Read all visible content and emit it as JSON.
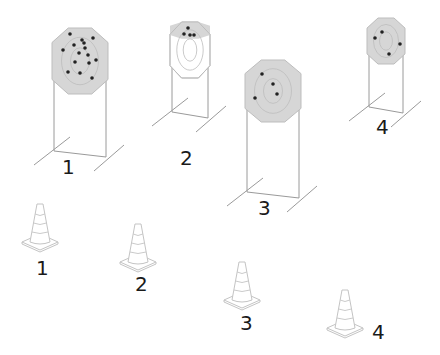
{
  "colors": {
    "target_fill": "#d6d6d6",
    "ring_stroke": "#bdbdbd",
    "line": "#9a9a9a",
    "hole": "#222222",
    "cone_stroke": "#c4c4c4",
    "label": "#1a1a1a"
  },
  "targets": [
    {
      "label": "1",
      "cx": 80,
      "top": 28,
      "w": 56,
      "h": 66,
      "base": 157,
      "label_x": 62,
      "label_y": 157,
      "holes": [
        [
          70,
          34
        ],
        [
          82,
          40
        ],
        [
          93,
          38
        ],
        [
          63,
          50
        ],
        [
          74,
          45
        ],
        [
          85,
          48
        ],
        [
          79,
          53
        ],
        [
          88,
          55
        ],
        [
          96,
          60
        ],
        [
          75,
          62
        ],
        [
          89,
          63
        ],
        [
          68,
          72
        ],
        [
          80,
          73
        ],
        [
          92,
          78
        ],
        [
          84,
          43
        ]
      ]
    },
    {
      "label": "2",
      "cx": 190,
      "top": 22,
      "w": 40,
      "h": 56,
      "base": 118,
      "label_x": 180,
      "label_y": 148,
      "faded": true,
      "holes": [
        [
          188,
          28
        ],
        [
          184,
          34
        ],
        [
          190,
          35
        ],
        [
          194,
          35
        ]
      ]
    },
    {
      "label": "3",
      "cx": 273,
      "top": 60,
      "w": 56,
      "h": 62,
      "base": 198,
      "label_x": 258,
      "label_y": 198,
      "holes": [
        [
          262,
          74
        ],
        [
          273,
          84
        ],
        [
          277,
          94
        ],
        [
          255,
          98
        ]
      ]
    },
    {
      "label": "4",
      "cx": 386,
      "top": 18,
      "w": 38,
      "h": 46,
      "base": 113,
      "label_x": 376,
      "label_y": 117,
      "holes": [
        [
          382,
          32
        ],
        [
          375,
          38
        ],
        [
          400,
          44
        ],
        [
          389,
          54
        ]
      ]
    }
  ],
  "cones": [
    {
      "label": "1",
      "x": 40,
      "y": 204,
      "label_x": 36,
      "label_y": 258
    },
    {
      "label": "2",
      "x": 138,
      "y": 224,
      "label_x": 135,
      "label_y": 274
    },
    {
      "label": "3",
      "x": 242,
      "y": 262,
      "label_x": 240,
      "label_y": 313
    },
    {
      "label": "4",
      "x": 345,
      "y": 290,
      "label_x": 372,
      "label_y": 322
    }
  ]
}
